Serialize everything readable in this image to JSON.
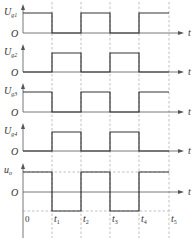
{
  "time_axis_label": "t",
  "origin_label": "O",
  "zero_label": "0",
  "time_marks": [
    "t1",
    "t2",
    "t3",
    "t4",
    "t5"
  ],
  "time_mark_x": [
    52,
    81,
    110,
    139,
    169
  ],
  "origin_x": 23,
  "axis_end_x": 184,
  "channels": [
    {
      "label": "Ug1",
      "main": "U",
      "sub": "g1",
      "high_y": 13,
      "base_y": 33,
      "pattern": [
        1,
        0,
        1,
        0,
        1
      ]
    },
    {
      "label": "Ug2",
      "main": "U",
      "sub": "g2",
      "high_y": 53,
      "base_y": 72,
      "pattern": [
        0,
        1,
        0,
        1,
        0
      ]
    },
    {
      "label": "Ug3",
      "main": "U",
      "sub": "g3",
      "high_y": 92,
      "base_y": 112,
      "pattern": [
        1,
        0,
        1,
        0,
        1
      ]
    },
    {
      "label": "Ug4",
      "main": "U",
      "sub": "g4",
      "high_y": 132,
      "base_y": 151,
      "pattern": [
        0,
        1,
        0,
        1,
        0
      ]
    }
  ],
  "output": {
    "label": "uo",
    "main": "u",
    "sub": "o",
    "high_y": 172,
    "zero_y": 192,
    "low_y": 211,
    "pattern": [
      1,
      -1,
      1,
      -1,
      1
    ]
  },
  "colors": {
    "wave": "#333333",
    "axis": "#555555",
    "dashed": "#999999"
  }
}
